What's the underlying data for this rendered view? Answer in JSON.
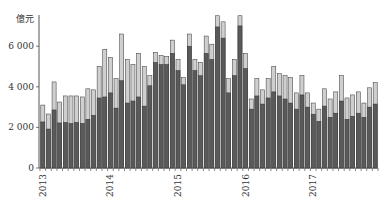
{
  "chart_data": {
    "type": "bar",
    "stacked": true,
    "title": "",
    "xlabel": "",
    "ylabel": "億元",
    "ylim": [
      0,
      7500
    ],
    "yticks": [
      0,
      2000,
      4000,
      6000
    ],
    "ytick_labels": [
      "0",
      "2 000",
      "4 000",
      "6 000"
    ],
    "xtick_labels": [
      "2013",
      "2014",
      "2015",
      "2016",
      "2017"
    ],
    "grid": false,
    "legend": null,
    "colors": {
      "bottom": "#5a5a5a",
      "top": "#cfcfcf",
      "outline": "#333333",
      "axis": "#555555"
    },
    "categories": [
      "2013-01",
      "2013-02",
      "2013-03",
      "2013-04",
      "2013-05",
      "2013-06",
      "2013-07",
      "2013-08",
      "2013-09",
      "2013-10",
      "2013-11",
      "2013-12",
      "2014-01",
      "2014-02",
      "2014-03",
      "2014-04",
      "2014-05",
      "2014-06",
      "2014-07",
      "2014-08",
      "2014-09",
      "2014-10",
      "2014-11",
      "2014-12",
      "2015-01",
      "2015-02",
      "2015-03",
      "2015-04",
      "2015-05",
      "2015-06",
      "2015-07",
      "2015-08",
      "2015-09",
      "2015-10",
      "2015-11",
      "2015-12",
      "2016-01",
      "2016-02",
      "2016-03",
      "2016-04",
      "2016-05",
      "2016-06",
      "2016-07",
      "2016-08",
      "2016-09",
      "2016-10",
      "2016-11",
      "2016-12",
      "2017-01",
      "2017-02",
      "2017-03",
      "2017-04",
      "2017-05",
      "2017-06",
      "2017-07",
      "2017-08",
      "2017-09",
      "2017-10",
      "2017-11",
      "2017-12"
    ],
    "series": [
      {
        "name": "bottom",
        "values": [
          2270,
          1920,
          2860,
          2220,
          2250,
          2200,
          2250,
          2200,
          2400,
          2600,
          3450,
          3500,
          3700,
          2950,
          4300,
          3200,
          3300,
          3500,
          3050,
          4050,
          5200,
          5100,
          5100,
          5650,
          4800,
          4100,
          6000,
          4800,
          4550,
          5650,
          5350,
          6950,
          6400,
          3700,
          4550,
          7000,
          4900,
          2900,
          3550,
          3150,
          3450,
          3750,
          3550,
          3400,
          3200,
          2900,
          3600,
          3000,
          2650,
          2300,
          3050,
          2500,
          2700,
          3300,
          2400,
          2550,
          2700,
          2500,
          3000,
          3150
        ]
      },
      {
        "name": "total",
        "values": [
          3100,
          2660,
          4240,
          3250,
          3550,
          3550,
          3550,
          3500,
          3900,
          3850,
          5000,
          5850,
          5450,
          4400,
          6600,
          5350,
          5100,
          5650,
          5000,
          4550,
          5700,
          5550,
          5500,
          6300,
          5350,
          4450,
          6600,
          5350,
          5200,
          6500,
          6100,
          7500,
          7200,
          4400,
          5350,
          7500,
          5650,
          3400,
          4400,
          3850,
          4400,
          5000,
          4650,
          4550,
          4450,
          3700,
          4550,
          3700,
          3200,
          2900,
          3900,
          3400,
          3750,
          4550,
          3450,
          3600,
          3750,
          3200,
          3950,
          4200
        ]
      }
    ]
  }
}
